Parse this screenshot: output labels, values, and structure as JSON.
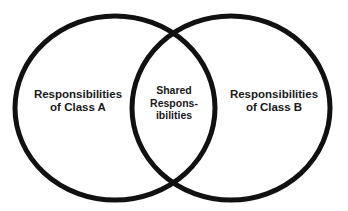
{
  "diagram": {
    "type": "venn",
    "stroke_color": "#111111",
    "background": "#ffffff",
    "sets": [
      {
        "id": "class-a",
        "lines": [
          "Responsibilities",
          "of Class A"
        ]
      },
      {
        "id": "class-b",
        "lines": [
          "Responsibilities",
          "of Class B"
        ]
      }
    ],
    "intersection": {
      "lines": [
        "Shared",
        "Respons-",
        "ibilities"
      ]
    }
  }
}
